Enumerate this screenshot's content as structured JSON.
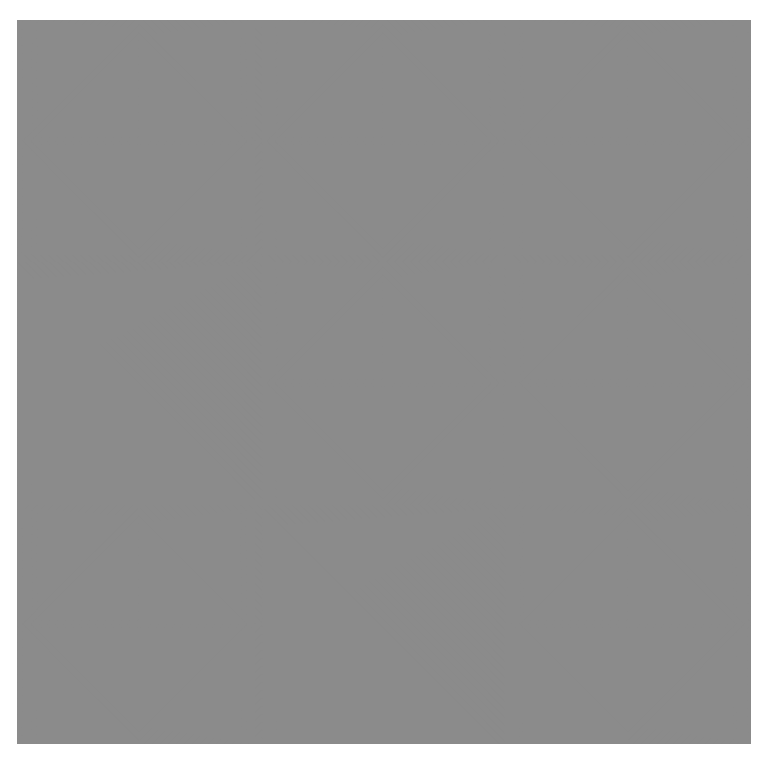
{
  "artwork": {
    "title": "Op-art concentric diamond pattern",
    "bounds": {
      "x": 17,
      "y": 20,
      "width": 734,
      "height": 724
    },
    "grid": {
      "cols": 3,
      "rows": 3,
      "col_edges": [
        0,
        245,
        488,
        734
      ],
      "row_edges": [
        0,
        242,
        485,
        724
      ]
    },
    "stripe_period": 8,
    "colors": {
      "light": "#8b8b8b",
      "dark": "#2e2e2e",
      "background": "#ffffff"
    },
    "panels": [
      {
        "cx": 122,
        "cy": 121
      },
      {
        "cx": 366,
        "cy": 121
      },
      {
        "cx": 611,
        "cy": 121
      },
      {
        "cx": 245,
        "cy": 242
      },
      {
        "cx": 366,
        "cy": 363
      },
      {
        "cx": 611,
        "cy": 363
      },
      {
        "cx": 122,
        "cy": 604
      },
      {
        "cx": 488,
        "cy": 485
      },
      {
        "cx": 611,
        "cy": 604
      }
    ]
  }
}
